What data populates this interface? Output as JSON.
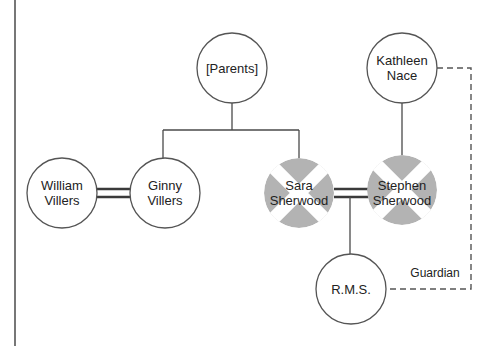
{
  "diagram": {
    "type": "genogram",
    "colors": {
      "line": "#4a4a4a",
      "circle_stroke": "#555555",
      "deceased_fill": "#b3b3b3",
      "text": "#222222",
      "background": "#ffffff"
    },
    "nodes": {
      "parents": {
        "line1": "[Parents]",
        "line2": "",
        "deceased": false
      },
      "kathleen": {
        "line1": "Kathleen",
        "line2": "Nace",
        "deceased": false
      },
      "william": {
        "line1": "William",
        "line2": "Villers",
        "deceased": false
      },
      "ginny": {
        "line1": "Ginny",
        "line2": "Villers",
        "deceased": false
      },
      "sara": {
        "line1": "Sara",
        "line2": "Sherwood",
        "deceased": true
      },
      "stephen": {
        "line1": "Stephen",
        "line2": "Sherwood",
        "deceased": true
      },
      "rms": {
        "line1": "R.M.S.",
        "line2": "",
        "deceased": false
      }
    },
    "edges": [
      {
        "from": "parents",
        "to": "ginny",
        "type": "parent-child"
      },
      {
        "from": "parents",
        "to": "sara",
        "type": "parent-child"
      },
      {
        "from": "william",
        "to": "ginny",
        "type": "marriage"
      },
      {
        "from": "sara",
        "to": "stephen",
        "type": "marriage"
      },
      {
        "from": "kathleen",
        "to": "stephen",
        "type": "parent-child"
      },
      {
        "from": "sara-stephen",
        "to": "rms",
        "type": "parent-child"
      },
      {
        "from": "kathleen",
        "to": "rms",
        "type": "guardian",
        "style": "dashed"
      }
    ],
    "edge_labels": {
      "guardian": "Guardian"
    }
  }
}
